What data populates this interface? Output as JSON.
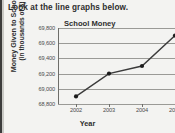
{
  "instruction": "Look at the line graphs below.",
  "chart_data": {
    "type": "line",
    "title": "School Money",
    "xlabel": "Year",
    "ylabel": "Money Given to Schools (in thousands of $)",
    "ylabel_line1": "Money Given to Schools",
    "ylabel_line2": "(in thousands of $)",
    "categories": [
      "2002",
      "2003",
      "2004",
      "2005"
    ],
    "values": [
      68900,
      69200,
      69300,
      69700
    ],
    "x": [
      2002,
      2003,
      2004,
      2005
    ],
    "ytick_labels": [
      "69,800",
      "69,600",
      "69,400",
      "69,200",
      "69,000",
      "68,800"
    ],
    "ytick_values": [
      69800,
      69600,
      69400,
      69200,
      69000,
      68800
    ],
    "ylim": [
      68800,
      69800
    ],
    "grid": true,
    "legend": "none",
    "marker": "filled-circle",
    "line_color": "#3b3b3b",
    "marker_color": "#1c1c1c",
    "grid_color": "#9a9a96",
    "last_point_clipped": true
  }
}
